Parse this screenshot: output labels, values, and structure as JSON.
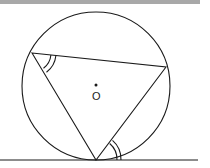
{
  "diagram": {
    "center_label": "O",
    "circle": {
      "cx": 96,
      "cy": 86,
      "r": 74
    },
    "triangle": {
      "vertices": [
        {
          "name": "left",
          "x": 32,
          "y": 53
        },
        {
          "name": "right",
          "x": 166,
          "y": 67
        },
        {
          "name": "bottom",
          "x": 96,
          "y": 160
        }
      ]
    },
    "tangent_line": {
      "x1": 0,
      "y1": 160,
      "x2": 198,
      "y2": 160
    },
    "angle_marks": [
      {
        "vertex": "left",
        "type": "double-arc"
      },
      {
        "vertex": "bottom",
        "between": "chord and tangent",
        "type": "double-arc"
      }
    ],
    "colors": {
      "stroke": "#1a1a1a",
      "background": "#ffffff",
      "topbar": "#a8a8a8"
    }
  }
}
